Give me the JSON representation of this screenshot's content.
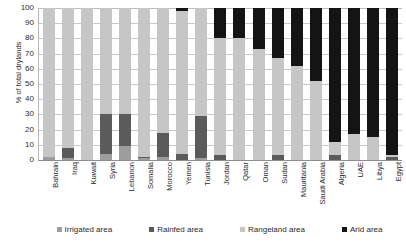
{
  "chart_data": {
    "type": "bar",
    "stacked": true,
    "title": "",
    "xlabel": "",
    "ylabel": "% of total drylands",
    "ylim": [
      0,
      100
    ],
    "ytick_step": 10,
    "yticks": [
      100,
      90,
      80,
      70,
      60,
      50,
      40,
      30,
      20,
      10,
      0
    ],
    "grid": true,
    "legend_position": "bottom",
    "categories": [
      "Bahrain",
      "Iraq",
      "Kuwait",
      "Syria",
      "Lebanon",
      "Somalia",
      "Morocco",
      "Yemen",
      "Tunisia",
      "Jordan",
      "Qatar",
      "Oman",
      "Sudan",
      "Mauritania",
      "Saudi Arabia",
      "Algeria",
      "UAE",
      "Libya",
      "Egypt"
    ],
    "series": [
      {
        "name": "Irrigated area",
        "color": "#9d9d9d",
        "values": [
          2,
          1,
          0,
          4,
          9,
          1,
          2,
          0,
          1,
          0,
          0,
          0,
          0,
          0,
          0,
          0,
          0,
          0,
          0
        ]
      },
      {
        "name": "Rainfed area",
        "color": "#5b5b5b",
        "values": [
          0,
          7,
          0,
          26,
          21,
          1,
          16,
          4,
          28,
          3,
          0,
          0,
          3,
          0,
          0,
          3,
          0,
          0,
          2
        ]
      },
      {
        "name": "Rangeland area",
        "color": "#c6c6c6",
        "values": [
          98,
          92,
          100,
          70,
          70,
          98,
          82,
          94,
          71,
          77,
          80,
          73,
          64,
          62,
          52,
          9,
          17,
          15,
          1
        ]
      },
      {
        "name": "Arid area",
        "color": "#141414",
        "values": [
          0,
          0,
          0,
          0,
          0,
          0,
          0,
          2,
          0,
          20,
          20,
          27,
          33,
          38,
          48,
          88,
          83,
          85,
          97
        ]
      }
    ],
    "legend": [
      {
        "label": "Irrigated area",
        "color": "#9d9d9d"
      },
      {
        "label": "Rainfed area",
        "color": "#5b5b5b"
      },
      {
        "label": "Rangeland area",
        "color": "#c6c6c6"
      },
      {
        "label": "Arid area",
        "color": "#141414"
      }
    ]
  }
}
